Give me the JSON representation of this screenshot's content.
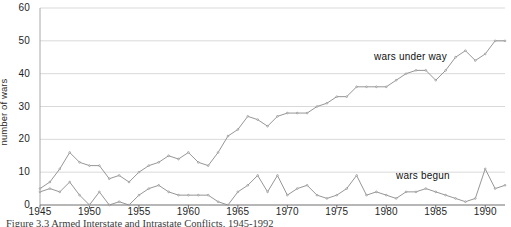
{
  "chart_data": {
    "type": "line",
    "title": "",
    "xlabel": "",
    "ylabel": "number of wars",
    "xlim": [
      1945,
      1992
    ],
    "ylim": [
      0,
      60
    ],
    "grid": true,
    "grid_axis": "y",
    "legend_position": "inline-annotations",
    "yticks": [
      0,
      10,
      20,
      30,
      40,
      50,
      60
    ],
    "xticks": [
      1945,
      1950,
      1955,
      1960,
      1965,
      1970,
      1975,
      1980,
      1985,
      1990
    ],
    "x": [
      1945,
      1946,
      1947,
      1948,
      1949,
      1950,
      1951,
      1952,
      1953,
      1954,
      1955,
      1956,
      1957,
      1958,
      1959,
      1960,
      1961,
      1962,
      1963,
      1964,
      1965,
      1966,
      1967,
      1968,
      1969,
      1970,
      1971,
      1972,
      1973,
      1974,
      1975,
      1976,
      1977,
      1978,
      1979,
      1980,
      1981,
      1982,
      1983,
      1984,
      1985,
      1986,
      1987,
      1988,
      1989,
      1990,
      1991,
      1992
    ],
    "series": [
      {
        "name": "wars under way",
        "color": "#8a8a8a",
        "values": [
          5,
          7,
          11,
          16,
          13,
          12,
          12,
          8,
          9,
          7,
          10,
          12,
          13,
          15,
          14,
          16,
          13,
          12,
          16,
          21,
          23,
          27,
          26,
          24,
          27,
          28,
          28,
          28,
          30,
          31,
          33,
          33,
          36,
          36,
          36,
          36,
          38,
          40,
          41,
          41,
          38,
          41,
          45,
          47,
          44,
          46,
          50,
          50
        ]
      },
      {
        "name": "wars begun",
        "color": "#8a8a8a",
        "values": [
          4,
          5,
          4,
          7,
          3,
          0,
          4,
          0,
          1,
          0,
          3,
          5,
          6,
          4,
          3,
          3,
          3,
          3,
          1,
          0,
          4,
          6,
          9,
          4,
          9,
          3,
          5,
          6,
          3,
          2,
          3,
          5,
          9,
          3,
          4,
          3,
          2,
          4,
          4,
          5,
          4,
          3,
          2,
          1,
          2,
          11,
          5,
          6
        ]
      }
    ],
    "annotations": [
      {
        "text": "wars under way",
        "x": 1984,
        "y": 44
      },
      {
        "text": "wars begun",
        "x": 1986,
        "y": 12
      }
    ]
  },
  "caption": {
    "text": "Figure 3.3   Armed Interstate and Intrastate Conflicts, 1945-1992"
  },
  "axis": {
    "ylabel": "number of wars",
    "yticks": [
      "0",
      "10",
      "20",
      "30",
      "40",
      "50",
      "60"
    ],
    "xticks": [
      "1945",
      "1950",
      "1955",
      "1960",
      "1965",
      "1970",
      "1975",
      "1980",
      "1985",
      "1990"
    ]
  },
  "colors": {
    "line": "#8a8a8a",
    "grid": "#d9d9d9",
    "axis": "#a8a8a8",
    "text": "#1f1f1f"
  }
}
